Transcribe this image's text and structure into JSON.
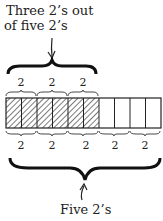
{
  "top_label": {
    "line1": "Three 2’s out",
    "line2": "of five 2’s"
  },
  "bottom_label": "Five 2’s",
  "bar": {
    "total_cells": 10,
    "shaded_cells": 6
  },
  "top_groups": [
    "2",
    "2",
    "2"
  ],
  "bottom_groups": [
    "2",
    "2",
    "2",
    "2",
    "2"
  ]
}
